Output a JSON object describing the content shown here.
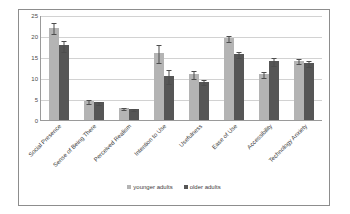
{
  "chart_data": {
    "type": "bar",
    "title": "",
    "subtitle": "",
    "xlabel": "",
    "ylabel": "",
    "ylim": [
      0,
      25
    ],
    "yticks": [
      0,
      5,
      10,
      15,
      20,
      25
    ],
    "grid": true,
    "legend_position": "bottom",
    "categories": [
      "Social Presence",
      "Sense of Being There",
      "Perceived Realism",
      "Intention to Use",
      "Usefulness",
      "Ease of Use",
      "Accessibility",
      "Technology Anxiety"
    ],
    "series": [
      {
        "name": "younger adults",
        "color": "#b4b4b4",
        "values": [
          22.0,
          4.5,
          2.9,
          16.0,
          10.9,
          19.5,
          11.0,
          14.1
        ],
        "errors": [
          1.3,
          0.4,
          0.3,
          2.1,
          0.9,
          0.7,
          0.7,
          0.6
        ]
      },
      {
        "name": "older adults",
        "color": "#565656",
        "values": [
          17.8,
          4.2,
          2.6,
          10.5,
          9.1,
          15.7,
          14.1,
          13.6
        ],
        "errors": [
          1.3,
          0.4,
          0.3,
          1.7,
          0.6,
          0.7,
          0.9,
          0.8
        ]
      }
    ]
  },
  "legend": {
    "entries": [
      {
        "label": "younger adults"
      },
      {
        "label": "older adults"
      }
    ]
  },
  "colors": {
    "younger": "#b4b4b4",
    "older": "#565656",
    "gridline": "#d2d2d2",
    "axis": "#9a9a9a",
    "frame": "#8d8d8d",
    "error": "#4d4d4d"
  }
}
